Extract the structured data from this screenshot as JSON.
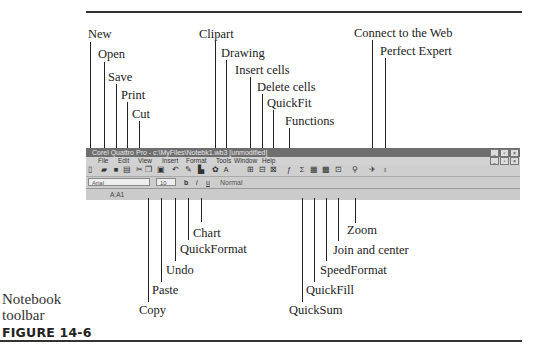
{
  "figure": {
    "number": "FIGURE 14-6",
    "caption_lines": [
      "Notebook",
      "toolbar"
    ]
  },
  "window": {
    "title": "Corel Quattro Pro - c:\\MyFiles\\Notebk1.wb3 [unmodified]",
    "menu": [
      "File",
      "Edit",
      "View",
      "Insert",
      "Format",
      "Tools",
      "Window",
      "Help"
    ],
    "font_name": "Arial",
    "font_size": "10",
    "style": "Normal",
    "cell_ref": "A:A1",
    "bold": "b",
    "italic": "i",
    "underline": "u"
  },
  "callouts_top": [
    {
      "label": "New",
      "x": 90
    },
    {
      "label": "Open",
      "x": 104
    },
    {
      "label": "Save",
      "x": 116
    },
    {
      "label": "Print",
      "x": 127
    },
    {
      "label": "Cut",
      "x": 139
    },
    {
      "label": "Clipart",
      "x": 215
    },
    {
      "label": "Drawing",
      "x": 226
    },
    {
      "label": "Insert cells",
      "x": 250
    },
    {
      "label": "Delete cells",
      "x": 262
    },
    {
      "label": "QuickFit",
      "x": 273
    },
    {
      "label": "Functions",
      "x": 289
    },
    {
      "label": "Connect to the Web",
      "x": 372
    },
    {
      "label": "Perfect Expert",
      "x": 385
    }
  ],
  "callouts_bottom": [
    {
      "label": "Copy",
      "x": 148
    },
    {
      "label": "Paste",
      "x": 161
    },
    {
      "label": "Undo",
      "x": 175
    },
    {
      "label": "QuickFormat",
      "x": 188
    },
    {
      "label": "Chart",
      "x": 201
    },
    {
      "label": "QuickSum",
      "x": 302
    },
    {
      "label": "QuickFill",
      "x": 314
    },
    {
      "label": "SpeedFormat",
      "x": 326
    },
    {
      "label": "Join and center",
      "x": 338
    },
    {
      "label": "Zoom",
      "x": 355
    }
  ],
  "icons": {
    "new": "▯",
    "open": "▰",
    "save": "■",
    "print": "▤",
    "cut": "✂",
    "copy": "❐",
    "paste": "▣",
    "undo": "↶",
    "quickformat": "✎",
    "chart": "▙",
    "clipart": "✿",
    "drawing": "A",
    "insert": "⊞",
    "delete": "⊟",
    "quickfit": "⊠",
    "functions": "ƒ",
    "quicksum": "Σ",
    "quickfill": "▦",
    "speedformat": "▩",
    "join": "⊡",
    "zoom": "⚲",
    "web": "✈",
    "expert": "♁"
  }
}
